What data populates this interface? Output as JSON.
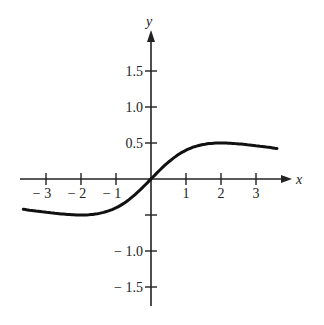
{
  "chart_data": {
    "type": "line",
    "title": "",
    "xlabel": "x",
    "ylabel": "y",
    "function_hint": "y = 2x / (x^2 + 4)",
    "xlim": [
      -3.65,
      3.6
    ],
    "ylim": [
      -1.8,
      2.0
    ],
    "grid": false,
    "legend": null,
    "x_ticks": [
      -3,
      -2,
      -1,
      1,
      2,
      3
    ],
    "x_tick_labels": [
      "− 3",
      "− 2",
      "− 1",
      "1",
      "2",
      "3"
    ],
    "y_ticks": [
      1.5,
      1.0,
      0.5,
      -0.5,
      -1.0,
      -1.5
    ],
    "y_tick_labels": [
      "1.5",
      "1.0",
      "0.5",
      "",
      "− 1.0",
      "− 1.5"
    ],
    "series": [
      {
        "name": "curve",
        "x": [
          -3.65,
          -3,
          -2.5,
          -2,
          -1.5,
          -1,
          -0.5,
          0,
          0.5,
          1,
          1.5,
          2,
          2.5,
          3,
          3.6
        ],
        "values": [
          -0.42,
          -0.46,
          -0.49,
          -0.5,
          -0.48,
          -0.4,
          -0.24,
          0,
          0.24,
          0.4,
          0.48,
          0.5,
          0.49,
          0.46,
          0.42
        ]
      }
    ]
  }
}
